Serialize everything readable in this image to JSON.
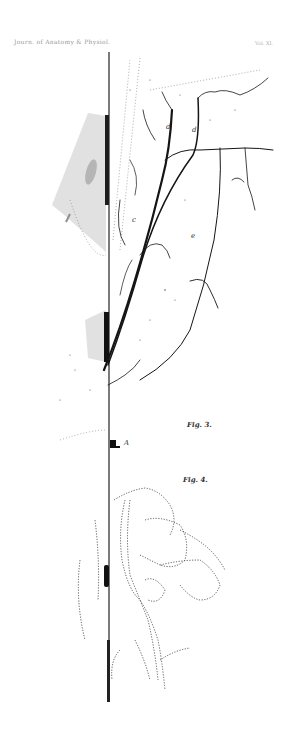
{
  "header": {
    "left_text": "Journ. of Anatomy & Physiol.",
    "right_text": "Vol. XI."
  },
  "figures": [
    {
      "id": "fig3",
      "caption": "Fig. 3.",
      "labels": [
        {
          "text": "d",
          "x": 166,
          "y": 128
        },
        {
          "text": "d",
          "x": 192,
          "y": 130
        },
        {
          "text": "c",
          "x": 132,
          "y": 222
        },
        {
          "text": "e",
          "x": 191,
          "y": 238
        }
      ]
    },
    {
      "id": "marker",
      "label": "A"
    },
    {
      "id": "fig4",
      "caption": "Fig. 4."
    }
  ],
  "colors": {
    "ink": "#1a1a1a",
    "shade": "#8a8a8a",
    "background": "#ffffff"
  }
}
